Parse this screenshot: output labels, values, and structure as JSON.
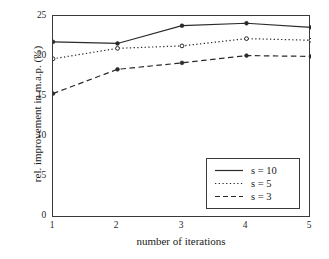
{
  "chart_data": {
    "type": "line",
    "title": "",
    "xlabel": "number of iterations",
    "ylabel": "rel. improvement in m.a.p. (%)",
    "x": [
      1,
      2,
      3,
      4,
      5
    ],
    "xticklabels": [
      "1",
      "2",
      "3",
      "4",
      "5"
    ],
    "yticks": [
      0,
      5,
      10,
      15,
      20,
      25
    ],
    "yticklabels": [
      "0",
      "5",
      "10",
      "15",
      "20",
      "25"
    ],
    "xlim": [
      1,
      5
    ],
    "ylim": [
      0,
      25
    ],
    "grid": false,
    "legend_position": "lower right",
    "series": [
      {
        "name": "s = 10",
        "style": "solid",
        "marker": "filled-circle",
        "color": "#2a2a2a",
        "values": [
          21.8,
          21.6,
          23.8,
          24.1,
          23.6
        ]
      },
      {
        "name": "s = 5",
        "style": "dotted",
        "marker": "open-circle",
        "color": "#2a2a2a",
        "values": [
          19.7,
          21.0,
          21.3,
          22.2,
          22.0
        ]
      },
      {
        "name": "s = 3",
        "style": "dashed",
        "marker": "filled-circle",
        "color": "#2a2a2a",
        "values": [
          15.4,
          18.4,
          19.2,
          20.1,
          20.0
        ]
      }
    ]
  },
  "axes": {
    "y_tick_0": "0",
    "y_tick_1": "5",
    "y_tick_2": "10",
    "y_tick_3": "15",
    "y_tick_4": "20",
    "y_tick_5": "25",
    "x_tick_0": "1",
    "x_tick_1": "2",
    "x_tick_2": "3",
    "x_tick_3": "4",
    "x_tick_4": "5",
    "xlabel": "number of iterations",
    "ylabel": "rel. improvement in m.a.p. (%)"
  },
  "legend": {
    "entries": [
      {
        "label": "s = 10"
      },
      {
        "label": "s = 5"
      },
      {
        "label": "s = 3"
      }
    ]
  }
}
